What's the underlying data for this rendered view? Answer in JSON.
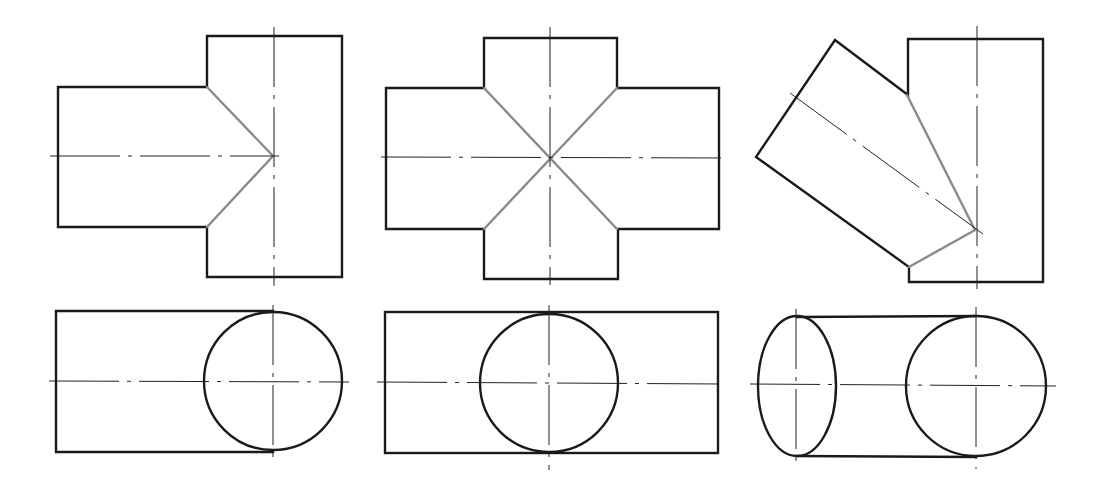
{
  "figure": {
    "colors": {
      "background": "#ffffff",
      "outline": "#1a1a1a",
      "intersection_line": "#8a8a8a",
      "center_line": "#222222"
    },
    "panels": [
      {
        "id": "tee",
        "front_view": {
          "branch_rect": {
            "x1": 58,
            "y1": 87,
            "x2": 207,
            "y2": 227
          },
          "main_rect": {
            "x1": 207,
            "y1": 36,
            "x2": 342,
            "y2": 277
          },
          "intersection": [
            [
              207,
              87
            ],
            [
              273,
              156
            ],
            [
              207,
              227
            ]
          ],
          "center_h": {
            "x1": 50,
            "y1": 156,
            "x2": 279,
            "y2": 156
          },
          "center_v": {
            "x1": 274,
            "y1": 27,
            "x2": 274,
            "y2": 286
          }
        },
        "top_view": {
          "rect": {
            "x1": 56,
            "y1": 311,
            "x2": 272,
            "y2": 452
          },
          "circle": {
            "cx": 273,
            "cy": 381,
            "r": 69
          },
          "center_h": {
            "x1": 49,
            "y1": 381,
            "x2": 349,
            "y2": 382
          },
          "center_v": {
            "x1": 273,
            "y1": 305,
            "x2": 273,
            "y2": 459
          }
        }
      },
      {
        "id": "cross",
        "front_view": {
          "outline": [
            [
              484,
              38
            ],
            [
              617,
              38
            ],
            [
              617,
              88
            ],
            [
              719,
              88
            ],
            [
              719,
              229
            ],
            [
              618,
              229
            ],
            [
              618,
              279
            ],
            [
              484,
              279
            ],
            [
              484,
              229
            ],
            [
              386,
              229
            ],
            [
              386,
              88
            ],
            [
              484,
              88
            ]
          ],
          "intersection": [
            [
              [
                484,
                88
              ],
              [
                617,
                229
              ]
            ],
            [
              [
                617,
                88
              ],
              [
                484,
                229
              ]
            ]
          ],
          "center_h": {
            "x1": 381,
            "y1": 157,
            "x2": 727,
            "y2": 158
          },
          "center_v": {
            "x1": 550,
            "y1": 27,
            "x2": 550,
            "y2": 285
          }
        },
        "top_view": {
          "rect": {
            "x1": 385,
            "y1": 312,
            "x2": 718,
            "y2": 453
          },
          "circle": {
            "cx": 549,
            "cy": 383,
            "r": 69
          },
          "center_h": {
            "x1": 377,
            "y1": 382,
            "x2": 722,
            "y2": 384
          },
          "center_v": {
            "x1": 549,
            "y1": 305,
            "x2": 549,
            "y2": 470
          }
        }
      },
      {
        "id": "oblique",
        "front_view": {
          "outline": [
            [
              908,
              95
            ],
            [
              908,
              39
            ],
            [
              1043,
              39
            ],
            [
              1043,
              282
            ],
            [
              909,
              282
            ],
            [
              909,
              267
            ],
            [
              756,
              157
            ],
            [
              835,
              40
            ],
            [
              908,
              95
            ]
          ],
          "intersection": [
            [
              907,
              95
            ],
            [
              975,
              230
            ],
            [
              909,
              267
            ]
          ],
          "center_oblique": {
            "x1": 790,
            "y1": 93,
            "x2": 983,
            "y2": 234
          },
          "center_v": {
            "x1": 977,
            "y1": 26,
            "x2": 977,
            "y2": 289
          }
        },
        "top_view": {
          "ellipse": {
            "cx": 797,
            "cy": 385,
            "rx": 39,
            "ry": 71
          },
          "circle": {
            "cx": 976,
            "cy": 386,
            "r": 69
          },
          "tangent_top": {
            "x1": 797,
            "y1": 318,
            "x2": 976,
            "y2": 316
          },
          "tangent_bottom": {
            "x1": 797,
            "y1": 456,
            "x2": 976,
            "y2": 458
          },
          "center_h": {
            "x1": 750,
            "y1": 384,
            "x2": 1056,
            "y2": 386
          },
          "center_v_left": {
            "x1": 796,
            "y1": 309,
            "x2": 796,
            "y2": 463
          },
          "center_v_right": {
            "x1": 976,
            "y1": 307,
            "x2": 976,
            "y2": 469
          }
        }
      }
    ]
  }
}
